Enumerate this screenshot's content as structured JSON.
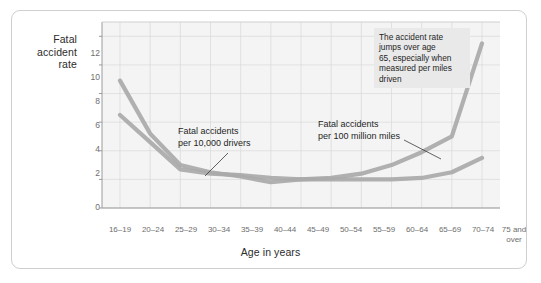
{
  "chart_data": {
    "type": "line",
    "title": "",
    "subtitle": "",
    "xlabel": "Age in years",
    "ylabel": "Fatal accident rate",
    "ylim": [
      0,
      13
    ],
    "yticks": [
      0,
      2,
      4,
      6,
      8,
      10,
      12
    ],
    "grid": true,
    "legend_position": "inline-annotations",
    "categories": [
      "16–19",
      "20–24",
      "25–29",
      "30–34",
      "35–39",
      "40–44",
      "45–49",
      "50–54",
      "55–59",
      "60–64",
      "65–69",
      "70–74",
      "75 and over"
    ],
    "series": [
      {
        "name": "Fatal accidents per 100 million miles",
        "color": "#a9a9a9",
        "values": [
          8.9,
          5.2,
          3.0,
          2.5,
          2.2,
          1.8,
          2.0,
          2.1,
          2.4,
          3.0,
          3.9,
          5.0,
          11.5
        ]
      },
      {
        "name": "Fatal accidents per 10,000 drivers",
        "color": "#a9a9a9",
        "values": [
          6.5,
          4.6,
          2.7,
          2.4,
          2.3,
          2.1,
          2.0,
          2.0,
          2.0,
          2.0,
          2.1,
          2.5,
          3.5
        ]
      }
    ],
    "annotations": [
      {
        "id": "note-box",
        "text": "The accident rate jumps over age 65, especially when measured per miles driven"
      },
      {
        "id": "label-drivers",
        "line1": "Fatal accidents",
        "line2": "per 10,000 drivers"
      },
      {
        "id": "label-miles",
        "line1": "Fatal accidents",
        "line2": "per 100 million miles"
      }
    ]
  },
  "axis": {
    "y_label_line1": "Fatal",
    "y_label_line2": "accident",
    "y_label_line3": "rate",
    "x_label": "Age in years",
    "yticks": [
      "12",
      "10",
      "8",
      "6",
      "4",
      "2",
      "0"
    ],
    "xticks": [
      {
        "line1": "16–19",
        "line2": ""
      },
      {
        "line1": "20–24",
        "line2": ""
      },
      {
        "line1": "25–29",
        "line2": ""
      },
      {
        "line1": "30–34",
        "line2": ""
      },
      {
        "line1": "35–39",
        "line2": ""
      },
      {
        "line1": "40–44",
        "line2": ""
      },
      {
        "line1": "45–49",
        "line2": ""
      },
      {
        "line1": "50–54",
        "line2": ""
      },
      {
        "line1": "55–59",
        "line2": ""
      },
      {
        "line1": "60–64",
        "line2": ""
      },
      {
        "line1": "65–69",
        "line2": ""
      },
      {
        "line1": "70–74",
        "line2": ""
      },
      {
        "line1": "75 and",
        "line2": "over"
      }
    ]
  },
  "annotations": {
    "note_line1": "The accident rate",
    "note_line2": "jumps over age",
    "note_line3": "65, especially when",
    "note_line4": "measured per miles",
    "note_line5": "driven",
    "drivers_line1": "Fatal accidents",
    "drivers_line2": "per 10,000 drivers",
    "miles_line1": "Fatal accidents",
    "miles_line2": "per 100 million miles"
  },
  "colors": {
    "line": "#a9a9a9",
    "plot_bg": "#f4f4f4",
    "grid": "#d8d8d8",
    "frame": "#cfcfcf",
    "note_bg": "#e9e9e9",
    "tick_text": "#6e6e6e",
    "label_text": "#1f1f1f"
  }
}
